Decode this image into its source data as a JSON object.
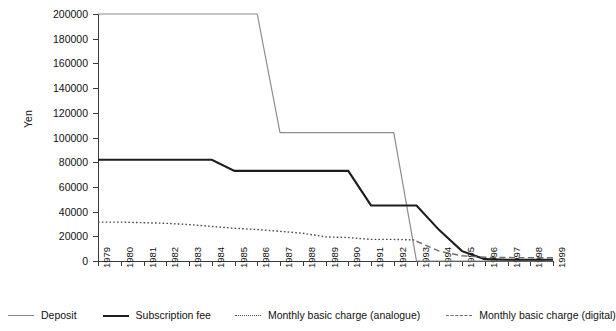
{
  "chart_data": {
    "type": "line",
    "title": "",
    "xlabel": "",
    "ylabel": "Yen",
    "ylim": [
      0,
      200000
    ],
    "ytick_labels": [
      "200000",
      "180000",
      "160000",
      "140000",
      "120000",
      "100000",
      "80000",
      "60000",
      "40000",
      "20000",
      "0"
    ],
    "ytick_values": [
      200000,
      180000,
      160000,
      140000,
      120000,
      100000,
      80000,
      60000,
      40000,
      20000,
      0
    ],
    "grid": false,
    "legend_position": "bottom",
    "categories": [
      "1979",
      "1980",
      "1981",
      "1982",
      "1983",
      "1984",
      "1985",
      "1986",
      "1987",
      "1988",
      "1989",
      "1990",
      "1991",
      "1992",
      "1993",
      "1994",
      "1995",
      "1996",
      "1997",
      "1998",
      "1999"
    ],
    "series": [
      {
        "name": "Deposit",
        "style": "solid",
        "color": "#8c8c8c",
        "values": [
          200000,
          200000,
          200000,
          200000,
          200000,
          200000,
          200000,
          200000,
          104000,
          104000,
          104000,
          104000,
          104000,
          104000,
          0,
          0,
          0,
          0,
          0,
          0,
          0
        ]
      },
      {
        "name": "Subscription fee",
        "style": "solid-bold",
        "color": "#1d1d1d",
        "values": [
          82000,
          82000,
          82000,
          82000,
          82000,
          82000,
          73000,
          73000,
          73000,
          73000,
          73000,
          73000,
          45000,
          45000,
          45000,
          25000,
          8000,
          1500,
          1000,
          1000,
          1000
        ]
      },
      {
        "name": "Monthly basic charge (analogue)",
        "style": "dotted",
        "color": "#4d4d4d",
        "values": [
          31500,
          31500,
          31000,
          30500,
          29500,
          28000,
          26500,
          25500,
          24000,
          22500,
          19500,
          19000,
          17500,
          17500,
          17000,
          null,
          null,
          null,
          null,
          null,
          null
        ]
      },
      {
        "name": "Monthly basic charge (digital)",
        "style": "dashed",
        "color": "#6b6b6b",
        "values": [
          null,
          null,
          null,
          null,
          null,
          null,
          null,
          null,
          null,
          null,
          null,
          null,
          null,
          null,
          16000,
          8000,
          4200,
          3000,
          2800,
          2700,
          2600
        ]
      }
    ]
  },
  "legend": {
    "items": [
      {
        "label": "Deposit",
        "style": "solid"
      },
      {
        "label": "Subscription fee",
        "style": "solid-bold"
      },
      {
        "label": "Monthly basic charge (analogue)",
        "style": "dotted"
      },
      {
        "label": "Monthly basic charge (digital)",
        "style": "dashed"
      }
    ]
  }
}
